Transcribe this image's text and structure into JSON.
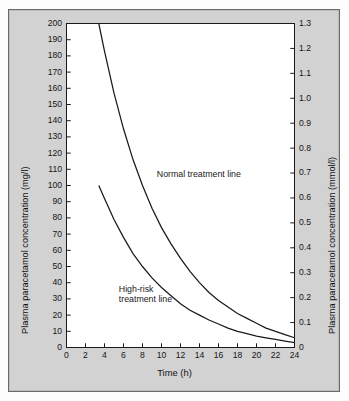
{
  "figure": {
    "background_color": "#d2d2d2",
    "plot_background": "#ffffff",
    "line_color": "#1a1a1a"
  },
  "axes": {
    "left_title": "Plasma paracetamol concentration (mg/l)",
    "right_title": "Plasma paracetamol concentration (mmol/l)",
    "x_title": "Time (h)",
    "left_ticks": [
      "0",
      "10",
      "20",
      "30",
      "40",
      "50",
      "60",
      "70",
      "80",
      "90",
      "100",
      "110",
      "120",
      "130",
      "140",
      "150",
      "160",
      "170",
      "180",
      "190",
      "200"
    ],
    "right_ticks": [
      "0",
      "0.1",
      "0.2",
      "0.3",
      "0.4",
      "0.5",
      "0.6",
      "0.7",
      "0.8",
      "0.9",
      "1.0",
      "1.1",
      "1.2",
      "1.3"
    ],
    "x_ticks": [
      "0",
      "2",
      "4",
      "6",
      "8",
      "10",
      "12",
      "14",
      "16",
      "18",
      "20",
      "22",
      "24"
    ]
  },
  "annotations": {
    "normal_line": "Normal treatment line",
    "high_risk_line_1": "High-risk",
    "high_risk_line_2": "treatment line"
  },
  "chart_data": {
    "type": "line",
    "title": "",
    "xlabel": "Time (h)",
    "ylabel": "Plasma paracetamol concentration (mg/l)",
    "ylabel_secondary": "Plasma paracetamol concentration (mmol/l)",
    "xlim": [
      0,
      24
    ],
    "ylim": [
      0,
      200
    ],
    "ylim_secondary": [
      0,
      1.3
    ],
    "grid": false,
    "legend": "inline-annotations",
    "x_tick_step": 2,
    "y_tick_step": 10,
    "y_secondary_tick_step": 0.1,
    "series": [
      {
        "name": "Normal treatment line",
        "x": [
          3.4,
          4,
          5,
          6,
          7,
          8,
          9,
          10,
          11,
          12,
          13,
          14,
          15,
          16,
          17,
          18,
          19,
          20,
          21,
          22,
          23,
          24
        ],
        "values": [
          200,
          183,
          157,
          135,
          116,
          100,
          86,
          74,
          64,
          55,
          47,
          40,
          34,
          29,
          25,
          21,
          18,
          15,
          12,
          10,
          8,
          6
        ]
      },
      {
        "name": "High-risk treatment line",
        "x": [
          3.4,
          4,
          5,
          6,
          7,
          8,
          9,
          10,
          11,
          12,
          13,
          14,
          15,
          16,
          17,
          18,
          19,
          20,
          21,
          22,
          23,
          24
        ],
        "values": [
          100,
          92,
          79,
          68,
          58,
          50,
          43,
          37,
          32,
          27,
          23,
          20,
          17,
          14.5,
          12,
          10,
          8.5,
          7,
          6,
          5,
          4,
          3
        ]
      }
    ],
    "annotations": [
      {
        "text": "Normal treatment line",
        "x": 9.5,
        "y": 107
      },
      {
        "text": "High-risk treatment line",
        "x": 5.5,
        "y": 33
      }
    ]
  }
}
